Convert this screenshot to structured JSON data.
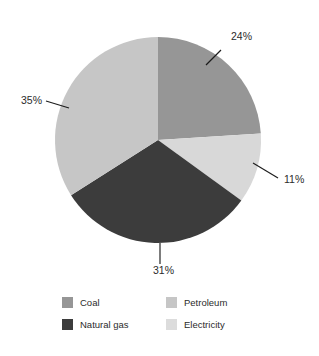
{
  "chart_data": {
    "type": "pie",
    "title": "",
    "subtitle": "",
    "xlabel": "",
    "ylabel": "",
    "grid": false,
    "legend_position": "bottom",
    "start_angle_deg": 0,
    "direction": "clockwise",
    "center": {
      "x": 158,
      "y": 140
    },
    "radius": 103,
    "categories": [
      "Coal",
      "Electricity",
      "Natural gas",
      "Petroleum"
    ],
    "values": [
      24,
      11,
      31,
      35
    ],
    "value_unit": "%",
    "slices": [
      {
        "name": "Coal",
        "value": 24,
        "label": "24%",
        "color": "#969696",
        "start_deg": 0,
        "end_deg": 86.4,
        "label_x": 231,
        "label_y": 40,
        "leader": {
          "x1": 221,
          "y1": 50,
          "x2": 206,
          "y2": 65
        }
      },
      {
        "name": "Electricity",
        "value": 11,
        "label": "11%",
        "color": "#d8d8d8",
        "start_deg": 86.4,
        "end_deg": 126.0,
        "label_x": 284,
        "label_y": 183,
        "leader": {
          "x1": 278,
          "y1": 178,
          "x2": 253,
          "y2": 163
        }
      },
      {
        "name": "Natural gas",
        "value": 31,
        "label": "31%",
        "color": "#3c3c3c",
        "start_deg": 126.0,
        "end_deg": 237.6,
        "label_x": 153,
        "label_y": 274,
        "leader": {
          "x1": 160,
          "y1": 243,
          "x2": 160,
          "y2": 264
        }
      },
      {
        "name": "Petroleum",
        "value": 35,
        "label": "35%",
        "color": "#c6c6c6",
        "start_deg": 237.6,
        "end_deg": 360.0,
        "label_x": 21,
        "label_y": 104,
        "leader": {
          "x1": 46,
          "y1": 101,
          "x2": 69,
          "y2": 108
        }
      }
    ],
    "legend": [
      {
        "label": "Coal",
        "color": "#969696"
      },
      {
        "label": "Petroleum",
        "color": "#c6c6c6"
      },
      {
        "label": "Natural gas",
        "color": "#3c3c3c"
      },
      {
        "label": "Electricity",
        "color": "#dcdcdc"
      }
    ]
  }
}
